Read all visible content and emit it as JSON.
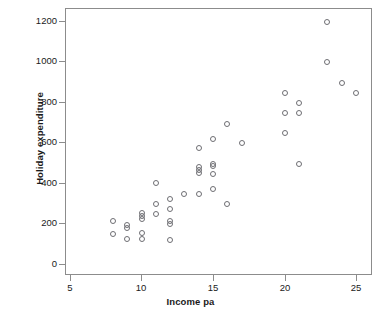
{
  "chart_data": {
    "type": "scatter",
    "title": "",
    "xlabel": "Income pa",
    "ylabel": "Holiday expenditure",
    "xlim": [
      3.5,
      26.5
    ],
    "ylim": [
      -60,
      1255
    ],
    "xticks": [
      5,
      10,
      15,
      20,
      25
    ],
    "yticks": [
      0,
      200,
      400,
      600,
      800,
      1000,
      1200
    ],
    "xtick_labels": [
      "5",
      "10",
      "15",
      "20",
      "25"
    ],
    "ytick_labels": [
      "0",
      "200",
      "400",
      "600",
      "800",
      "1000",
      "1200"
    ],
    "grid": false,
    "legend": null,
    "marker": "open-circle",
    "marker_color": "#6e6e73",
    "n_points": 48,
    "points": [
      {
        "x": 8,
        "y": 210
      },
      {
        "x": 8,
        "y": 150
      },
      {
        "x": 9,
        "y": 195
      },
      {
        "x": 9,
        "y": 180
      },
      {
        "x": 9,
        "y": 125
      },
      {
        "x": 10,
        "y": 250
      },
      {
        "x": 10,
        "y": 235
      },
      {
        "x": 10,
        "y": 222
      },
      {
        "x": 10,
        "y": 152
      },
      {
        "x": 10,
        "y": 122
      },
      {
        "x": 11,
        "y": 398
      },
      {
        "x": 11,
        "y": 297
      },
      {
        "x": 11,
        "y": 248
      },
      {
        "x": 12,
        "y": 322
      },
      {
        "x": 12,
        "y": 272
      },
      {
        "x": 12,
        "y": 213
      },
      {
        "x": 12,
        "y": 198
      },
      {
        "x": 12,
        "y": 120
      },
      {
        "x": 13,
        "y": 347
      },
      {
        "x": 14,
        "y": 572
      },
      {
        "x": 14,
        "y": 480
      },
      {
        "x": 14,
        "y": 462
      },
      {
        "x": 14,
        "y": 448
      },
      {
        "x": 14,
        "y": 347
      },
      {
        "x": 15,
        "y": 615
      },
      {
        "x": 15,
        "y": 492
      },
      {
        "x": 15,
        "y": 482
      },
      {
        "x": 15,
        "y": 445
      },
      {
        "x": 15,
        "y": 372
      },
      {
        "x": 16,
        "y": 693
      },
      {
        "x": 16,
        "y": 295
      },
      {
        "x": 17,
        "y": 597
      },
      {
        "x": 20,
        "y": 843
      },
      {
        "x": 20,
        "y": 745
      },
      {
        "x": 20,
        "y": 645
      },
      {
        "x": 21,
        "y": 795
      },
      {
        "x": 21,
        "y": 745
      },
      {
        "x": 21,
        "y": 495
      },
      {
        "x": 23,
        "y": 1193
      },
      {
        "x": 23,
        "y": 997
      },
      {
        "x": 24,
        "y": 895
      },
      {
        "x": 25,
        "y": 845
      }
    ]
  },
  "caption_sliver": ""
}
